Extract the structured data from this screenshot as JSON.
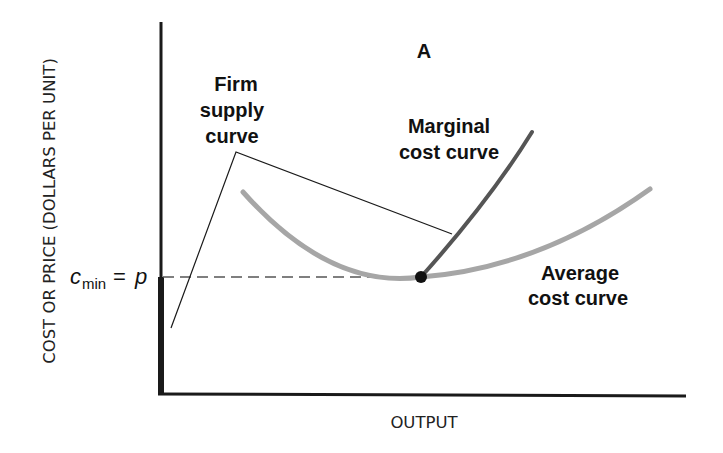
{
  "diagram": {
    "panel_label": "A",
    "axes": {
      "y_label": "COST OR PRICE (DOLLARS PER UNIT)",
      "x_label": "OUTPUT"
    },
    "price_marker": {
      "symbol": "c",
      "subscript": "min",
      "equals": "=",
      "rhs": "p"
    },
    "curves": {
      "supply": {
        "label_line1": "Firm",
        "label_line2": "supply",
        "label_line3": "curve"
      },
      "marginal": {
        "label_line1": "Marginal",
        "label_line2": "cost curve"
      },
      "average": {
        "label_line1": "Average",
        "label_line2": "cost curve"
      }
    },
    "colors": {
      "axis": "#1a1a1a",
      "marginal_cost": "#555555",
      "average_cost": "#a6a6a6",
      "dashed": "#555555",
      "pointer": "#1a1a1a",
      "point": "#111111"
    }
  }
}
